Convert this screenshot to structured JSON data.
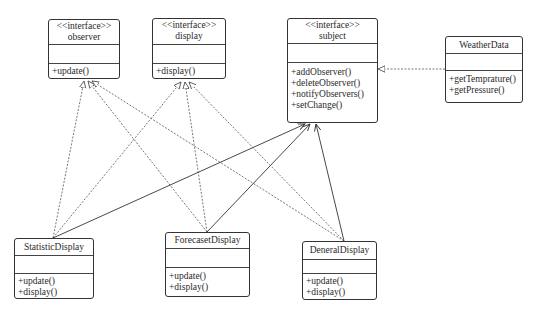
{
  "diagram": {
    "type": "UML class diagram",
    "classes": [
      {
        "id": "observer",
        "stereotype": "<<interface>>",
        "name": "observer",
        "attributes": [],
        "operations": [
          "+update()"
        ]
      },
      {
        "id": "display",
        "stereotype": "<<interface>>",
        "name": "display",
        "attributes": [],
        "operations": [
          "+display()"
        ]
      },
      {
        "id": "subject",
        "stereotype": "<<interface>>",
        "name": "subject",
        "attributes": [],
        "operations": [
          "+addObserver()",
          "+deleteObserver()",
          "+notifyObservers()",
          "+setChange()"
        ]
      },
      {
        "id": "weatherdata",
        "stereotype": "",
        "name": "WeatherData",
        "attributes": [],
        "operations": [
          "+getTemprature()",
          "+getPressure()"
        ]
      },
      {
        "id": "statisticdisplay",
        "stereotype": "",
        "name": "StatisticDisplay",
        "attributes": [],
        "operations": [
          "+update()",
          "+display()"
        ]
      },
      {
        "id": "forecasetdisplay",
        "stereotype": "",
        "name": "ForecasetDisplay",
        "attributes": [],
        "operations": [
          "+update()",
          "+display()"
        ]
      },
      {
        "id": "deneraldisplay",
        "stereotype": "",
        "name": "DeneralDisplay",
        "attributes": [],
        "operations": [
          "+update()",
          "+display()"
        ]
      }
    ],
    "relationships": [
      {
        "from": "StatisticDisplay",
        "to": "observer",
        "kind": "realization"
      },
      {
        "from": "StatisticDisplay",
        "to": "display",
        "kind": "realization"
      },
      {
        "from": "StatisticDisplay",
        "to": "subject",
        "kind": "association"
      },
      {
        "from": "ForecasetDisplay",
        "to": "observer",
        "kind": "realization"
      },
      {
        "from": "ForecasetDisplay",
        "to": "display",
        "kind": "realization"
      },
      {
        "from": "ForecasetDisplay",
        "to": "subject",
        "kind": "association"
      },
      {
        "from": "DeneralDisplay",
        "to": "observer",
        "kind": "realization"
      },
      {
        "from": "DeneralDisplay",
        "to": "display",
        "kind": "realization"
      },
      {
        "from": "DeneralDisplay",
        "to": "subject",
        "kind": "association"
      },
      {
        "from": "WeatherData",
        "to": "subject",
        "kind": "realization"
      }
    ]
  }
}
